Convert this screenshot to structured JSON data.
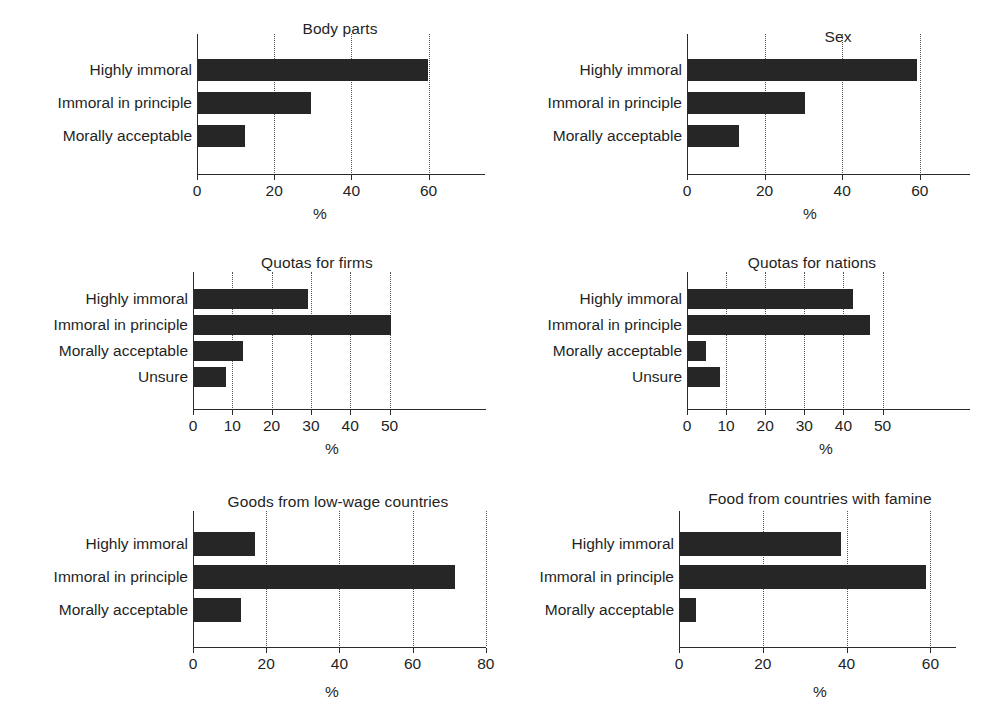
{
  "figure": {
    "panel_count": 6,
    "bar_color": "#262626",
    "axis_color": "#2b2b2b",
    "background": "#ffffff"
  },
  "chart_data": [
    {
      "type": "bar",
      "orientation": "horizontal",
      "title": "Body parts",
      "xlabel": "%",
      "ylabel": "",
      "categories": [
        "Highly immoral",
        "Immoral in principle",
        "Morally acceptable"
      ],
      "values": [
        59.6,
        29.2,
        12.3
      ],
      "xlim": [
        0,
        62
      ],
      "xticks": [
        0,
        20,
        40,
        60
      ],
      "xticklabels": [
        "0",
        "20",
        "40",
        "60"
      ],
      "grid": "vertical-dotted",
      "legend": "none"
    },
    {
      "type": "bar",
      "orientation": "horizontal",
      "title": "Sex",
      "xlabel": "%",
      "ylabel": "",
      "categories": [
        "Highly immoral",
        "Immoral in principle",
        "Morally acceptable"
      ],
      "values": [
        59.1,
        30.1,
        13.1
      ],
      "xlim": [
        0,
        62
      ],
      "xticks": [
        0,
        20,
        40,
        60
      ],
      "xticklabels": [
        "0",
        "20",
        "40",
        "60"
      ],
      "grid": "vertical-dotted",
      "legend": "none"
    },
    {
      "type": "bar",
      "orientation": "horizontal",
      "title": "Quotas for firms",
      "xlabel": "%",
      "ylabel": "",
      "categories": [
        "Highly immoral",
        "Immoral in principle",
        "Morally acceptable",
        "Unsure"
      ],
      "values": [
        29.0,
        50.2,
        12.5,
        8.2
      ],
      "xlim": [
        0,
        52
      ],
      "xticks": [
        0,
        10,
        20,
        30,
        40,
        50
      ],
      "xticklabels": [
        "0",
        "10",
        "20",
        "30",
        "40",
        "50"
      ],
      "grid": "vertical-dotted",
      "legend": "none"
    },
    {
      "type": "bar",
      "orientation": "horizontal",
      "title": "Quotas for nations",
      "xlabel": "%",
      "ylabel": "",
      "categories": [
        "Highly immoral",
        "Immoral in principle",
        "Morally acceptable",
        "Unsure"
      ],
      "values": [
        42.2,
        46.6,
        4.5,
        8.3
      ],
      "xlim": [
        0,
        52
      ],
      "xticks": [
        0,
        10,
        20,
        30,
        40,
        50
      ],
      "xticklabels": [
        "0",
        "10",
        "20",
        "30",
        "40",
        "50"
      ],
      "grid": "vertical-dotted",
      "legend": "none"
    },
    {
      "type": "bar",
      "orientation": "horizontal",
      "title": "Goods from low-wage countries",
      "xlabel": "%",
      "ylabel": "",
      "categories": [
        "Highly immoral",
        "Immoral in principle",
        "Morally acceptable"
      ],
      "values": [
        16.8,
        71.2,
        12.9
      ],
      "xlim": [
        0,
        80
      ],
      "xticks": [
        0,
        20,
        40,
        60,
        80
      ],
      "xticklabels": [
        "0",
        "20",
        "40",
        "60",
        "80"
      ],
      "grid": "vertical-dotted",
      "legend": "none"
    },
    {
      "type": "bar",
      "orientation": "horizontal",
      "title": "Food from countries with famine",
      "xlabel": "%",
      "ylabel": "",
      "categories": [
        "Highly immoral",
        "Immoral in principle",
        "Morally acceptable"
      ],
      "values": [
        38.5,
        58.8,
        3.8
      ],
      "xlim": [
        0,
        62
      ],
      "xticks": [
        0,
        20,
        40,
        60
      ],
      "xticklabels": [
        "0",
        "20",
        "40",
        "60"
      ],
      "grid": "vertical-dotted",
      "legend": "none"
    }
  ]
}
